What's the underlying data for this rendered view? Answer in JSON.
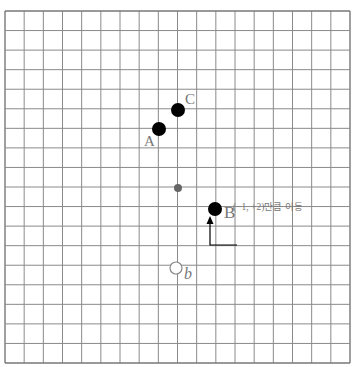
{
  "grid": {
    "left": 5,
    "top": 11,
    "right": 350,
    "bottom": 363,
    "cols": 18,
    "rows": 18,
    "line_color": "#8a8a8a",
    "border_color": "#777777"
  },
  "points": [
    {
      "id": "C",
      "label": "C",
      "x": 178,
      "y": 110,
      "r": 7,
      "fill": "#000000",
      "type": "solid",
      "label_dx": 7,
      "label_dy": -18,
      "label_size": 15
    },
    {
      "id": "A",
      "label": "A",
      "x": 159,
      "y": 129,
      "r": 7,
      "fill": "#000000",
      "type": "solid",
      "label_dx": -15,
      "label_dy": 5,
      "label_size": 15
    },
    {
      "id": "center",
      "label": "",
      "x": 178,
      "y": 188,
      "r": 4,
      "fill": "#666666",
      "type": "small"
    },
    {
      "id": "B",
      "label": "B",
      "x": 215,
      "y": 209,
      "r": 7,
      "fill": "#000000",
      "type": "solid",
      "label_dx": 9,
      "label_dy": -5,
      "label_size": 17
    },
    {
      "id": "b",
      "label": "b",
      "x": 176,
      "y": 268,
      "r": 6,
      "fill": "#ffffff",
      "type": "hollow",
      "label_dx": 8,
      "label_dy": -2,
      "label_size": 16
    }
  ],
  "annotation": {
    "text": "(−1, +2)만큼 이동",
    "x": 233,
    "y": 203
  },
  "arrow": {
    "path": [
      [
        237,
        245
      ],
      [
        210,
        245
      ],
      [
        210,
        218
      ]
    ],
    "color": "#000000"
  }
}
